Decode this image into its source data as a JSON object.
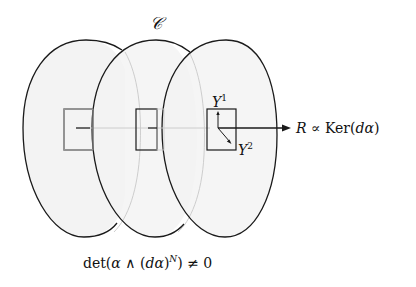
{
  "diagram": {
    "top_label": "𝒞",
    "vector_y1": {
      "base": "Y",
      "sup": "1"
    },
    "vector_y2": {
      "base": "Y",
      "sup": "2"
    },
    "reeb_label": {
      "R": "R",
      "prop": " ∝ ",
      "ker": "Ker(",
      "d": "d",
      "alpha": "α",
      "close": ")"
    },
    "condition": {
      "prefix": "det(",
      "alpha": "α",
      "wedge": " ∧ ",
      "open": "(",
      "d": "d",
      "alpha2": "α",
      "close": ")",
      "sup": "N",
      "suffix": ") ≠ 0"
    },
    "colors": {
      "stroke": "#1a1a1a",
      "fill": "#f2f2f2",
      "faint": "#c8c8c8"
    }
  }
}
